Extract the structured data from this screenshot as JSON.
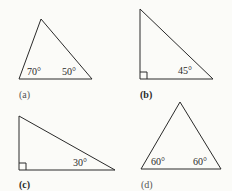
{
  "figures": [
    {
      "id": "a",
      "caption": "(a)",
      "angles": [
        "70°",
        "50°"
      ],
      "right_angle": false
    },
    {
      "id": "b",
      "caption": "(b)",
      "angles": [
        "45°"
      ],
      "right_angle": true
    },
    {
      "id": "c",
      "caption": "(c)",
      "angles": [
        "30°"
      ],
      "right_angle": true
    },
    {
      "id": "d",
      "caption": "(d)",
      "angles": [
        "60°",
        "60°"
      ],
      "right_angle": false
    }
  ],
  "colors": {
    "stroke": "#2a2a2a",
    "background": "#fbfbf8"
  }
}
